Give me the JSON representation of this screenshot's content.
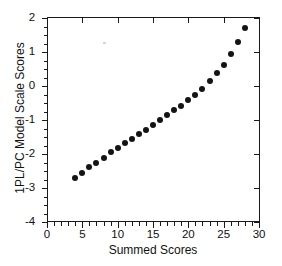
{
  "chart_data": {
    "type": "scatter",
    "title": "",
    "xlabel": "Summed Scores",
    "ylabel": "1PL/PC Model Scale Scores",
    "xlim": [
      0,
      30
    ],
    "ylim": [
      -4,
      2
    ],
    "xticks": [
      0,
      5,
      10,
      15,
      20,
      25,
      30
    ],
    "yticks": [
      2,
      1,
      0,
      -1,
      -2,
      -3,
      -4
    ],
    "xtick_labels": [
      "0",
      "5",
      "10",
      "15",
      "20",
      "25",
      "30"
    ],
    "ytick_labels": [
      "2",
      "1",
      "0",
      "-1",
      "-2",
      "-3",
      "-4"
    ],
    "grid": false,
    "legend": null,
    "marker": "filled-circle",
    "marker_color": "#141414",
    "x": [
      4,
      5,
      6,
      7,
      8,
      9,
      10,
      11,
      12,
      13,
      14,
      15,
      16,
      17,
      18,
      19,
      20,
      21,
      22,
      23,
      24,
      25,
      26,
      27,
      28
    ],
    "values": [
      -2.72,
      -2.55,
      -2.38,
      -2.25,
      -2.12,
      -1.95,
      -1.82,
      -1.67,
      -1.55,
      -1.4,
      -1.3,
      -1.15,
      -1.0,
      -0.86,
      -0.72,
      -0.6,
      -0.42,
      -0.26,
      -0.08,
      0.16,
      0.39,
      0.63,
      0.94,
      1.28,
      1.7
    ],
    "series": [
      {
        "name": "1PL/PC model scale score",
        "x": [
          4,
          5,
          6,
          7,
          8,
          9,
          10,
          11,
          12,
          13,
          14,
          15,
          16,
          17,
          18,
          19,
          20,
          21,
          22,
          23,
          24,
          25,
          26,
          27,
          28
        ],
        "values": [
          -2.72,
          -2.55,
          -2.38,
          -2.25,
          -2.12,
          -1.95,
          -1.82,
          -1.67,
          -1.55,
          -1.4,
          -1.3,
          -1.15,
          -1.0,
          -0.86,
          -0.72,
          -0.6,
          -0.42,
          -0.26,
          -0.08,
          0.16,
          0.39,
          0.63,
          0.94,
          1.28,
          1.7
        ]
      }
    ],
    "n_points": 25
  },
  "figure": {
    "background_color": "#ffffff",
    "axis_color": "#1a1a1a"
  }
}
